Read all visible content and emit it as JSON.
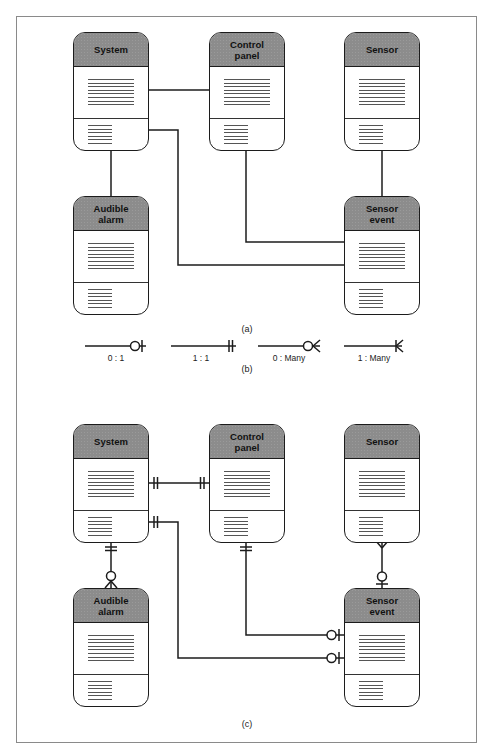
{
  "figure": {
    "panels": {
      "a": {
        "caption": "(a)",
        "entities": {
          "system": {
            "title": "System"
          },
          "control_panel": {
            "title": "Control\npanel"
          },
          "sensor": {
            "title": "Sensor"
          },
          "audible_alarm": {
            "title": "Audible\nalarm"
          },
          "sensor_event": {
            "title": "Sensor\nevent"
          }
        },
        "relationships": [
          {
            "from": "System",
            "to": "Control panel"
          },
          {
            "from": "System",
            "to": "Audible alarm"
          },
          {
            "from": "System",
            "to": "Sensor event"
          },
          {
            "from": "Control panel",
            "to": "Sensor event"
          },
          {
            "from": "Sensor",
            "to": "Sensor event"
          }
        ]
      },
      "b": {
        "caption": "(b)",
        "notations": [
          {
            "label": "0 : 1",
            "symbol": "circle-bar"
          },
          {
            "label": "1 : 1",
            "symbol": "double-bar"
          },
          {
            "label": "0 : Many",
            "symbol": "circle-crowsfoot"
          },
          {
            "label": "1 : Many",
            "symbol": "bar-crowsfoot"
          }
        ]
      },
      "c": {
        "caption": "(c)",
        "entities": {
          "system": {
            "title": "System"
          },
          "control_panel": {
            "title": "Control\npanel"
          },
          "sensor": {
            "title": "Sensor"
          },
          "audible_alarm": {
            "title": "Audible\nalarm"
          },
          "sensor_event": {
            "title": "Sensor\nevent"
          }
        },
        "relationships": [
          {
            "from": "System",
            "from_card": "1:1",
            "to": "Control panel",
            "to_card": "1:1"
          },
          {
            "from": "System",
            "from_card": "1:1",
            "to": "Audible alarm",
            "to_card": "0:Many"
          },
          {
            "from": "System",
            "from_card": "1:1",
            "to": "Sensor event",
            "to_card": "0:1"
          },
          {
            "from": "Control panel",
            "from_card": "1:1",
            "to": "Sensor event",
            "to_card": "0:1"
          },
          {
            "from": "Sensor",
            "from_card": "Many",
            "to": "Sensor event",
            "to_card": "0:1"
          }
        ]
      }
    },
    "colors": {
      "header_fill": "#8c8c8c",
      "stroke": "#1c1c1c",
      "frame": "#8a8a8a"
    }
  }
}
